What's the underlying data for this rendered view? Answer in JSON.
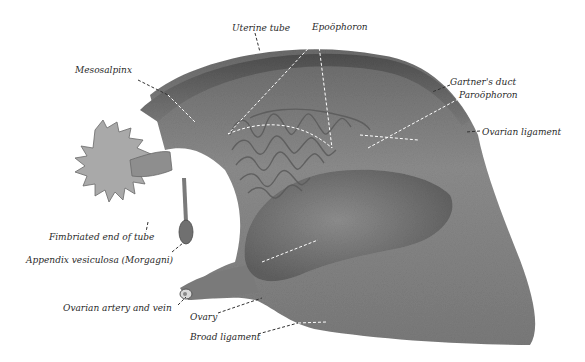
{
  "figure": {
    "colors": {
      "tissue_dark": "#5a5a5a",
      "tissue_mid": "#8a8a8a",
      "tissue_light": "#b8b8b8",
      "fimbriae": "#a9a9a9",
      "leader_line": "#ffffff",
      "text": "#2a2a2a",
      "background": "#ffffff"
    }
  },
  "labels": [
    {
      "id": "uterine-tube",
      "text": "Uterine tube",
      "x": 232,
      "y": 24
    },
    {
      "id": "epoophoron",
      "text": "Epoöphoron",
      "x": 312,
      "y": 23
    },
    {
      "id": "mesosalpinx",
      "text": "Mesosalpinx",
      "x": 75,
      "y": 66
    },
    {
      "id": "gartners-duct",
      "text": "Gartner's duct",
      "x": 450,
      "y": 78
    },
    {
      "id": "paroophoron",
      "text": "Paroöphoron",
      "x": 459,
      "y": 91
    },
    {
      "id": "ovarian-ligament",
      "text": "Ovarian ligament",
      "x": 482,
      "y": 128
    },
    {
      "id": "fimbriated-end",
      "text": "Fimbriated end of tube",
      "x": 49,
      "y": 233
    },
    {
      "id": "appendix-vesiculosa",
      "text": "Appendix vesiculosa (Morgagni)",
      "x": 26,
      "y": 256
    },
    {
      "id": "ovarian-artery-vein",
      "text": "Ovarian artery and vein",
      "x": 63,
      "y": 304
    },
    {
      "id": "ovary",
      "text": "Ovary",
      "x": 190,
      "y": 313
    },
    {
      "id": "broad-ligament",
      "text": "Broad ligament",
      "x": 190,
      "y": 333
    }
  ]
}
